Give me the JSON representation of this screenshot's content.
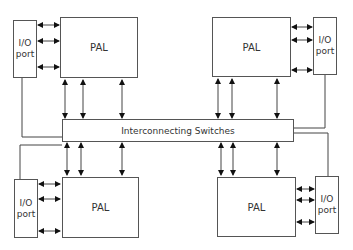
{
  "diagram": {
    "switches": {
      "label": "Interconnecting Switches"
    },
    "modules": [
      {
        "id": "top-left",
        "pal_label": "PAL",
        "io_label_line1": "I/O",
        "io_label_line2": "port"
      },
      {
        "id": "top-right",
        "pal_label": "PAL",
        "io_label_line1": "I/O",
        "io_label_line2": "port"
      },
      {
        "id": "bottom-left",
        "pal_label": "PAL",
        "io_label_line1": "I/O",
        "io_label_line2": "port"
      },
      {
        "id": "bottom-right",
        "pal_label": "PAL",
        "io_label_line1": "I/O",
        "io_label_line2": "port"
      }
    ],
    "colors": {
      "line": "#333333",
      "border": "#555555",
      "text": "#333333"
    }
  }
}
